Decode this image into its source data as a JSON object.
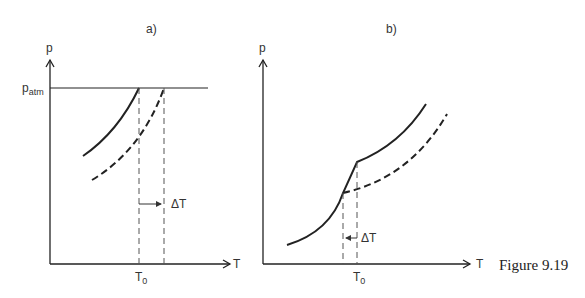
{
  "figure": {
    "caption": "Figure 9.19",
    "panels": [
      {
        "id": "a",
        "title": "a)",
        "y_axis_label": "p",
        "x_axis_label": "T",
        "hline_label_main": "p",
        "hline_label_sub": "atm",
        "delta_label": "ΔT",
        "t0_label_main": "T",
        "t0_label_sub": "0"
      },
      {
        "id": "b",
        "title": "b)",
        "y_axis_label": "p",
        "x_axis_label": "T",
        "delta_label": "ΔT",
        "t0_label_main": "T",
        "t0_label_sub": "0"
      }
    ]
  },
  "colors": {
    "ink": "#222222",
    "dash": "#555555"
  }
}
